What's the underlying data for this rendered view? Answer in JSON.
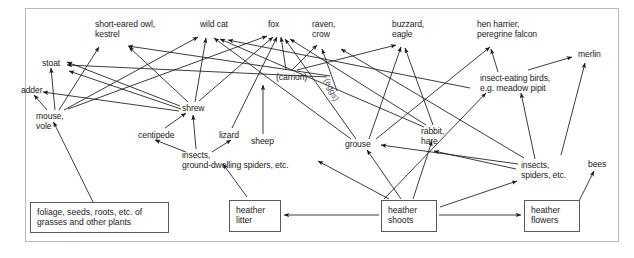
{
  "figure": {
    "background_color": "#ffffff",
    "border_color": "#b9b9b9",
    "arrow_color": "#1a1a1a",
    "text_color": "#222222",
    "box_border_color": "#5a5a5a",
    "width": 634,
    "height": 258
  },
  "nodes": [
    {
      "id": "short_eared_owl",
      "name": "short-eared-owl-kestrel-label",
      "text": "short-eared owl,\nkestrel",
      "x": 95,
      "y": 20,
      "align": "left",
      "type": "text"
    },
    {
      "id": "wild_cat",
      "name": "wild-cat-label",
      "text": "wild cat",
      "x": 200,
      "y": 20,
      "align": "left",
      "type": "text"
    },
    {
      "id": "fox",
      "name": "fox-label",
      "text": "fox",
      "x": 268,
      "y": 20,
      "align": "left",
      "type": "text"
    },
    {
      "id": "raven_crow",
      "name": "raven-crow-label",
      "text": "raven,\ncrow",
      "x": 312,
      "y": 20,
      "align": "left",
      "type": "text"
    },
    {
      "id": "buzzard_eagle",
      "name": "buzzard-eagle-label",
      "text": "buzzard,\neagle",
      "x": 392,
      "y": 20,
      "align": "left",
      "type": "text"
    },
    {
      "id": "hen_harrier",
      "name": "hen-harrier-peregrine-label",
      "text": "hen harrier,\nperegrine falcon",
      "x": 477,
      "y": 20,
      "align": "left",
      "type": "text"
    },
    {
      "id": "merlin",
      "name": "merlin-label",
      "text": "merlin",
      "x": 578,
      "y": 50,
      "align": "left",
      "type": "text"
    },
    {
      "id": "stoat",
      "name": "stoat-label",
      "text": "stoat",
      "x": 42,
      "y": 59,
      "align": "left",
      "type": "text"
    },
    {
      "id": "adder",
      "name": "adder-label",
      "text": "adder",
      "x": 21,
      "y": 86,
      "align": "left",
      "type": "text"
    },
    {
      "id": "carrion",
      "name": "carrion-label",
      "text": "(carrion)",
      "x": 276,
      "y": 73,
      "align": "left",
      "type": "text"
    },
    {
      "id": "eggs",
      "name": "eggs-label",
      "text": "(eggs)",
      "x": 330,
      "y": 77,
      "align": "left",
      "type": "rotated",
      "rotation": 64
    },
    {
      "id": "insect_birds",
      "name": "insect-eating-birds-label",
      "text": "insect-eating birds,\ne.g. meadow pipit",
      "x": 480,
      "y": 74,
      "align": "left",
      "type": "text"
    },
    {
      "id": "mouse_vole",
      "name": "mouse-vole-label",
      "text": "mouse,\nvole",
      "x": 36,
      "y": 112,
      "align": "left",
      "type": "text"
    },
    {
      "id": "shrew",
      "name": "shrew-label",
      "text": "shrew",
      "x": 182,
      "y": 104,
      "align": "left",
      "type": "text"
    },
    {
      "id": "centipede",
      "name": "centipede-label",
      "text": "centipede",
      "x": 138,
      "y": 131,
      "align": "left",
      "type": "text"
    },
    {
      "id": "lizard",
      "name": "lizard-label",
      "text": "lizard",
      "x": 219,
      "y": 131,
      "align": "left",
      "type": "text"
    },
    {
      "id": "sheep",
      "name": "sheep-label",
      "text": "sheep",
      "x": 251,
      "y": 137,
      "align": "left",
      "type": "text"
    },
    {
      "id": "grouse",
      "name": "grouse-label",
      "text": "grouse",
      "x": 345,
      "y": 140,
      "align": "left",
      "type": "text"
    },
    {
      "id": "rabbit_hare",
      "name": "rabbit-hare-label",
      "text": "rabbit,\nhare",
      "x": 421,
      "y": 127,
      "align": "left",
      "type": "text"
    },
    {
      "id": "insects_ground",
      "name": "insects-ground-spiders-label",
      "text": "insects,\nground-dwelling spiders, etc.",
      "x": 182,
      "y": 151,
      "align": "left",
      "type": "text"
    },
    {
      "id": "insects_spiders",
      "name": "insects-spiders-label",
      "text": "insects,\nspiders, etc.",
      "x": 521,
      "y": 161,
      "align": "left",
      "type": "text"
    },
    {
      "id": "bees",
      "name": "bees-label",
      "text": "bees",
      "x": 588,
      "y": 160,
      "align": "left",
      "type": "text"
    }
  ],
  "boxes": [
    {
      "id": "foliage",
      "name": "foliage-seeds-roots-box",
      "text": "foliage, seeds, roots, etc. of\ngrasses and other plants",
      "x": 30,
      "y": 202,
      "w": 139,
      "h": 31
    },
    {
      "id": "heather_litter",
      "name": "heather-litter-box",
      "text": "heather\nlitter",
      "x": 229,
      "y": 200,
      "w": 52,
      "h": 32
    },
    {
      "id": "heather_shoots",
      "name": "heather-shoots-box",
      "text": "heather\nshoots",
      "x": 381,
      "y": 200,
      "w": 56,
      "h": 32
    },
    {
      "id": "heather_flowers",
      "name": "heather-flowers-box",
      "text": "heather\nflowers",
      "x": 524,
      "y": 200,
      "w": 56,
      "h": 32
    }
  ],
  "chart_data": {
    "type": "diagram",
    "diagram_kind": "food-web",
    "producers": [
      "foliage, seeds, roots, etc. of grasses and other plants",
      "heather shoots",
      "heather flowers",
      "heather litter"
    ],
    "edge_style": "single-headed arrow = energy flow from food to consumer",
    "edges": [
      {
        "from": "foliage",
        "to": "mouse_vole",
        "x1": 93,
        "y1": 202,
        "x2": 53,
        "y2": 122
      },
      {
        "from": "mouse_vole",
        "to": "adder",
        "x1": 47,
        "y1": 110,
        "x2": 33,
        "y2": 94
      },
      {
        "from": "mouse_vole",
        "to": "stoat",
        "x1": 54,
        "y1": 110,
        "x2": 51,
        "y2": 68
      },
      {
        "from": "mouse_vole",
        "to": "short_eared_owl",
        "x1": 58,
        "y1": 110,
        "x2": 98,
        "y2": 46
      },
      {
        "from": "mouse_vole",
        "to": "wild_cat",
        "x1": 64,
        "y1": 110,
        "x2": 197,
        "y2": 36
      },
      {
        "from": "mouse_vole",
        "to": "fox",
        "x1": 67,
        "y1": 109,
        "x2": 268,
        "y2": 35
      },
      {
        "from": "shrew",
        "to": "stoat",
        "x1": 180,
        "y1": 106,
        "x2": 66,
        "y2": 62
      },
      {
        "from": "shrew",
        "to": "stoat2",
        "x1": 181,
        "y1": 108,
        "x2": 68,
        "y2": 70
      },
      {
        "from": "shrew",
        "to": "short_eared_owl",
        "x1": 188,
        "y1": 102,
        "x2": 128,
        "y2": 47
      },
      {
        "from": "shrew",
        "to": "wild_cat",
        "x1": 194,
        "y1": 102,
        "x2": 205,
        "y2": 37
      },
      {
        "from": "shrew",
        "to": "fox",
        "x1": 198,
        "y1": 101,
        "x2": 274,
        "y2": 36
      },
      {
        "from": "shrew",
        "to": "adder",
        "x1": 180,
        "y1": 110,
        "x2": 42,
        "y2": 92
      },
      {
        "from": "insects_ground",
        "to": "shrew",
        "x1": 196,
        "y1": 149,
        "x2": 193,
        "y2": 114
      },
      {
        "from": "insects_ground",
        "to": "centipede",
        "x1": 185,
        "y1": 152,
        "x2": 154,
        "y2": 140
      },
      {
        "from": "insects_ground",
        "to": "lizard",
        "x1": 212,
        "y1": 152,
        "x2": 231,
        "y2": 140
      },
      {
        "from": "centipede",
        "to": "shrew",
        "x1": 164,
        "y1": 128,
        "x2": 185,
        "y2": 113
      },
      {
        "from": "lizard",
        "to": "fox",
        "x1": 231,
        "y1": 128,
        "x2": 277,
        "y2": 36
      },
      {
        "from": "heather_litter",
        "to": "insects_ground",
        "x1": 246,
        "y1": 198,
        "x2": 222,
        "y2": 164
      },
      {
        "from": "heather_shoots",
        "to": "heather_litter",
        "x1": 379,
        "y1": 215,
        "x2": 284,
        "y2": 215
      },
      {
        "from": "heather_shoots",
        "to": "heather_flowers",
        "x1": 439,
        "y1": 215,
        "x2": 521,
        "y2": 215
      },
      {
        "from": "heather_shoots",
        "to": "grouse",
        "x1": 400,
        "y1": 198,
        "x2": 366,
        "y2": 150
      },
      {
        "from": "heather_shoots",
        "to": "rabbit_hare",
        "x1": 412,
        "y1": 198,
        "x2": 432,
        "y2": 140
      },
      {
        "from": "heather_shoots",
        "to": "sheep",
        "x1": 389,
        "y1": 198,
        "x2": 318,
        "y2": 160
      },
      {
        "from": "heather_shoots",
        "to": "insects_spiders",
        "x1": 440,
        "y1": 206,
        "x2": 518,
        "y2": 180
      },
      {
        "from": "heather_shoots",
        "to": "insect_birds",
        "x1": 384,
        "y1": 198,
        "x2": 485,
        "y2": 92
      },
      {
        "from": "heather_flowers",
        "to": "bees",
        "x1": 578,
        "y1": 203,
        "x2": 594,
        "y2": 170
      },
      {
        "from": "sheep",
        "to": "carrion",
        "x1": 263,
        "y1": 134,
        "x2": 263,
        "y2": 84
      },
      {
        "from": "carrion",
        "to": "raven_crow",
        "x1": 292,
        "y1": 70,
        "x2": 318,
        "y2": 44
      },
      {
        "from": "carrion",
        "to": "buzzard_eagle",
        "x1": 296,
        "y1": 70,
        "x2": 396,
        "y2": 44
      },
      {
        "from": "carrion",
        "to": "fox",
        "x1": 285,
        "y1": 70,
        "x2": 281,
        "y2": 36
      },
      {
        "from": "eggs",
        "to": "raven_crow",
        "x1": 336,
        "y1": 90,
        "x2": 322,
        "y2": 48
      },
      {
        "from": "eggs",
        "to": "stoat",
        "x1": 327,
        "y1": 76,
        "x2": 66,
        "y2": 64
      },
      {
        "from": "grouse",
        "to": "hen_harrier",
        "x1": 375,
        "y1": 138,
        "x2": 490,
        "y2": 46
      },
      {
        "from": "grouse",
        "to": "buzzard_eagle",
        "x1": 368,
        "y1": 138,
        "x2": 400,
        "y2": 46
      },
      {
        "from": "grouse",
        "to": "fox",
        "x1": 355,
        "y1": 138,
        "x2": 285,
        "y2": 38
      },
      {
        "from": "grouse",
        "to": "wild_cat",
        "x1": 350,
        "y1": 138,
        "x2": 213,
        "y2": 37
      },
      {
        "from": "rabbit_hare",
        "to": "buzzard_eagle",
        "x1": 432,
        "y1": 125,
        "x2": 404,
        "y2": 47
      },
      {
        "from": "rabbit_hare",
        "to": "fox",
        "x1": 425,
        "y1": 125,
        "x2": 290,
        "y2": 38
      },
      {
        "from": "rabbit_hare",
        "to": "wild_cat",
        "x1": 423,
        "y1": 126,
        "x2": 219,
        "y2": 38
      },
      {
        "from": "insects_spiders",
        "to": "insect_birds",
        "x1": 535,
        "y1": 159,
        "x2": 520,
        "y2": 92
      },
      {
        "from": "insects_spiders",
        "to": "grouse",
        "x1": 518,
        "y1": 163,
        "x2": 380,
        "y2": 144
      },
      {
        "from": "insects_spiders",
        "to": "lizard_far",
        "x1": 516,
        "y1": 168,
        "x2": 430,
        "y2": 150
      },
      {
        "from": "insects_spiders",
        "to": "raven_crow",
        "x1": 524,
        "y1": 158,
        "x2": 340,
        "y2": 48
      },
      {
        "from": "insect_birds",
        "to": "hen_harrier",
        "x1": 498,
        "y1": 72,
        "x2": 491,
        "y2": 48
      },
      {
        "from": "insect_birds",
        "to": "merlin",
        "x1": 528,
        "y1": 70,
        "x2": 573,
        "y2": 56
      },
      {
        "from": "insects_spiders",
        "to": "merlin",
        "x1": 560,
        "y1": 155,
        "x2": 585,
        "y2": 62
      }
    ]
  },
  "edges_render": [
    {
      "name": "edge-foliage-mouse",
      "d": "M93,202 L53.5,122",
      "head": 1
    },
    {
      "name": "edge-mouse-adder",
      "d": "M47,110 L34,95",
      "head": 1
    },
    {
      "name": "edge-mouse-stoat",
      "d": "M55,110 L51,68",
      "head": 1
    },
    {
      "name": "edge-mouse-owl",
      "d": "M59,110 L99,47",
      "head": 1
    },
    {
      "name": "edge-mouse-wildcat",
      "d": "M64,110 L198,37",
      "head": 1
    },
    {
      "name": "edge-mouse-fox",
      "d": "M68,109 L267,36",
      "head": 1
    },
    {
      "name": "edge-shrew-stoat-a",
      "d": "M180,106 L67,62",
      "head": 1
    },
    {
      "name": "edge-shrew-stoat-b",
      "d": "M181,109 L69,71",
      "head": 1
    },
    {
      "name": "edge-shrew-owl",
      "d": "M188,102 L129,47",
      "head": 1
    },
    {
      "name": "edge-shrew-wildcat",
      "d": "M195,102 L206,38",
      "head": 1
    },
    {
      "name": "edge-shrew-fox",
      "d": "M199,101 L273,37",
      "head": 1
    },
    {
      "name": "edge-shrew-adder",
      "d": "M179,111 L43,92",
      "head": 1
    },
    {
      "name": "edge-insectsground-shrew",
      "d": "M196,149 L193,115",
      "head": 1
    },
    {
      "name": "edge-insectsground-centipede",
      "d": "M186,152 L155,140",
      "head": 1
    },
    {
      "name": "edge-insectsground-lizard",
      "d": "M212,152 L231,140",
      "head": 1
    },
    {
      "name": "edge-centipede-shrew",
      "d": "M165,128 L186,113",
      "head": 1
    },
    {
      "name": "edge-lizard-fox",
      "d": "M232,128 L277,37",
      "head": 1
    },
    {
      "name": "edge-heatherlitter-insects",
      "d": "M247,197 L223,164",
      "head": 1
    },
    {
      "name": "edge-shoots-litter",
      "d": "M379,215 L284,215",
      "head": 1
    },
    {
      "name": "edge-shoots-flowers",
      "d": "M439,215 L521,215",
      "head": 1
    },
    {
      "name": "edge-shoots-grouse",
      "d": "M401,199 L367,150",
      "head": 1
    },
    {
      "name": "edge-shoots-rabbit",
      "d": "M413,199 L432,141",
      "head": 1
    },
    {
      "name": "edge-shoots-sheep",
      "d": "M389,199 L318,161",
      "head": 1
    },
    {
      "name": "edge-shoots-insectsspiders",
      "d": "M440,207 L517,181",
      "head": 1
    },
    {
      "name": "edge-shoots-insectbirds",
      "d": "M384,199 L486,93",
      "head": 1
    },
    {
      "name": "edge-flowers-bees",
      "d": "M578,203 L594,171",
      "head": 1
    },
    {
      "name": "edge-sheep-carrion",
      "d": "M263,134 L263,85",
      "head": 1
    },
    {
      "name": "edge-carrion-raven",
      "d": "M292,70 L317,45",
      "head": 1
    },
    {
      "name": "edge-carrion-buzzard",
      "d": "M297,70 L396,45",
      "head": 1
    },
    {
      "name": "edge-carrion-fox",
      "d": "M286,70 L281,37",
      "head": 1
    },
    {
      "name": "edge-eggs-raven",
      "d": "M337,91 L322,49",
      "head": 1
    },
    {
      "name": "edge-eggs-stoat",
      "d": "M327,77 L67,65",
      "head": 1
    },
    {
      "name": "edge-grouse-henharrier",
      "d": "M376,139 L490,47",
      "head": 1
    },
    {
      "name": "edge-grouse-buzzard",
      "d": "M369,139 L401,47",
      "head": 1
    },
    {
      "name": "edge-grouse-fox",
      "d": "M356,139 L285,39",
      "head": 1
    },
    {
      "name": "edge-grouse-wildcat",
      "d": "M351,139 L214,38",
      "head": 1
    },
    {
      "name": "edge-rabbit-buzzard",
      "d": "M433,125 L405,48",
      "head": 1
    },
    {
      "name": "edge-rabbit-fox",
      "d": "M426,125 L290,39",
      "head": 1
    },
    {
      "name": "edge-rabbit-wildcat",
      "d": "M424,127 L220,39",
      "head": 1
    },
    {
      "name": "edge-insectsspiders-birds",
      "d": "M535,159 L521,93",
      "head": 1
    },
    {
      "name": "edge-insectsspiders-grouse",
      "d": "M518,164 L381,145",
      "head": 1
    },
    {
      "name": "edge-insectsspiders-rabbit",
      "d": "M516,169 L434,151",
      "head": 1
    },
    {
      "name": "edge-insectsspiders-raven",
      "d": "M524,158 L341,49",
      "head": 1
    },
    {
      "name": "edge-insectbirds-henharrier",
      "d": "M498,72 L491,49",
      "head": 1
    },
    {
      "name": "edge-insectbirds-merlin",
      "d": "M528,70 L572,57",
      "head": 1
    },
    {
      "name": "edge-insectsspiders-merlin",
      "d": "M561,155 L585,63",
      "head": 1
    },
    {
      "name": "edge-cross-owl-long",
      "d": "M330,76 L128,46",
      "head": 1
    },
    {
      "name": "edge-cross-wildcat-long",
      "d": "M470,88 L228,40",
      "head": 1
    }
  ]
}
